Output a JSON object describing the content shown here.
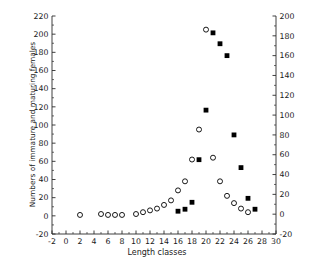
{
  "chart_data": {
    "type": "scatter",
    "title": "",
    "xlabel": "Length classes",
    "ylabel": "Numbers of immature and maturing females",
    "ylabel_right": "Numbers of mature and spent females",
    "xlim": [
      -2,
      30
    ],
    "xtick_step": 2,
    "xticks": [
      -2,
      0,
      2,
      4,
      6,
      8,
      10,
      12,
      14,
      16,
      18,
      20,
      22,
      24,
      26,
      28,
      30
    ],
    "minor_xtick_step": 1,
    "ylim": [
      -20,
      220
    ],
    "yticks": [
      -20,
      0,
      20,
      40,
      60,
      80,
      100,
      120,
      140,
      160,
      180,
      200,
      220
    ],
    "ylim_right": [
      -20,
      200
    ],
    "yticks_right": [
      -20,
      0,
      20,
      40,
      60,
      80,
      100,
      120,
      140,
      160,
      180,
      200
    ],
    "grid": false,
    "legend": false,
    "series": [
      {
        "name": "Numbers of immature and maturing females",
        "marker": "open-circle",
        "axis": "left",
        "color": "#000000",
        "points": [
          [
            2,
            1
          ],
          [
            5,
            2
          ],
          [
            6,
            1
          ],
          [
            7,
            1
          ],
          [
            8,
            1
          ],
          [
            10,
            2
          ],
          [
            11,
            4
          ],
          [
            12,
            6
          ],
          [
            13,
            8
          ],
          [
            14,
            12
          ],
          [
            15,
            17
          ],
          [
            16,
            28
          ],
          [
            17,
            38
          ],
          [
            18,
            62
          ],
          [
            19,
            95
          ],
          [
            20,
            205
          ],
          [
            21,
            64
          ],
          [
            22,
            38
          ],
          [
            23,
            22
          ],
          [
            24,
            14
          ],
          [
            25,
            8
          ],
          [
            26,
            4
          ]
        ]
      },
      {
        "name": "Numbers of mature and spent females",
        "marker": "filled-square",
        "axis": "right",
        "color": "#000000",
        "points": [
          [
            16,
            3
          ],
          [
            17,
            5
          ],
          [
            18,
            12
          ],
          [
            19,
            55
          ],
          [
            20,
            105
          ],
          [
            21,
            183
          ],
          [
            22,
            172
          ],
          [
            23,
            160
          ],
          [
            24,
            80
          ],
          [
            25,
            47
          ],
          [
            26,
            16
          ],
          [
            27,
            5
          ]
        ]
      }
    ]
  },
  "axes": {
    "x_label": "Length classes",
    "y_left_label": "Numbers of immature and maturing females",
    "y_right_label": "Numbers of mature and spent females"
  }
}
